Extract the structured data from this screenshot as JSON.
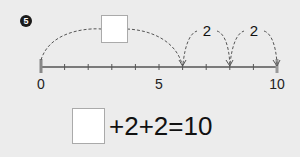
{
  "problem": {
    "number_label": "5"
  },
  "number_line": {
    "min": 0,
    "max": 10,
    "step": 1,
    "labels": [
      {
        "value": 0,
        "text": "0"
      },
      {
        "value": 5,
        "text": "5"
      },
      {
        "value": 10,
        "text": "10"
      }
    ],
    "jumps": [
      {
        "from": 0,
        "to": 6,
        "label": "",
        "has_blank_box": true
      },
      {
        "from": 6,
        "to": 8,
        "label": "2"
      },
      {
        "from": 8,
        "to": 10,
        "label": "2"
      }
    ]
  },
  "equation": {
    "blank": "",
    "text": "+2+2=10"
  },
  "colors": {
    "background": "#ececec",
    "line": "#555555",
    "box": "#ffffff"
  }
}
